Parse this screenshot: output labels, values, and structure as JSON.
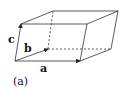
{
  "figure": {
    "caption": "(a)",
    "labels": {
      "a": "a",
      "b": "b",
      "c": "c"
    },
    "colors": {
      "stroke": "#222222",
      "background": "#ffffff"
    }
  }
}
